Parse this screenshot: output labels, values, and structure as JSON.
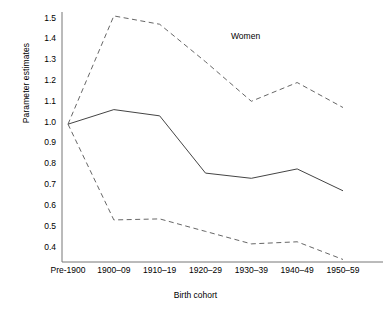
{
  "chart_data": {
    "type": "line",
    "title": "",
    "annotation": "Women",
    "xlabel": "Birth cohort",
    "ylabel": "Parameter estimates",
    "categories": [
      "Pre-1900",
      "1900–09",
      "1910–19",
      "1920–29",
      "1930–39",
      "1940–49",
      "1950–59"
    ],
    "ylim": [
      0.34,
      1.55
    ],
    "yticks": [
      1.5,
      1.4,
      1.3,
      1.2,
      1.1,
      1.0,
      0.9,
      0.8,
      0.7,
      0.6,
      0.5,
      0.4
    ],
    "ytick_labels": [
      "1.5",
      "1.4",
      "1.3",
      "1.2",
      "1.1",
      "1.0",
      "0.9",
      "0.8",
      "0.7",
      "0.6",
      "0.5",
      "0.4"
    ],
    "grid": false,
    "legend": "none",
    "series": [
      {
        "name": "Upper 95% confidence limit",
        "style": "dashed",
        "color": "#555555",
        "values": [
          0.99,
          1.51,
          1.47,
          1.29,
          1.1,
          1.19,
          1.07
        ]
      },
      {
        "name": "Parameter estimate",
        "style": "solid",
        "color": "#444444",
        "values": [
          0.99,
          1.06,
          1.03,
          0.755,
          0.73,
          0.775,
          0.67
        ]
      },
      {
        "name": "Lower 95% confidence limit",
        "style": "dashed",
        "color": "#555555",
        "values": [
          0.99,
          0.53,
          0.535,
          0.475,
          0.415,
          0.425,
          0.34
        ]
      }
    ]
  },
  "axes": {
    "axis_color": "#777777"
  }
}
